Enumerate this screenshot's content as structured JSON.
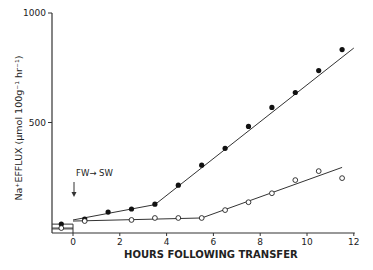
{
  "chart_data": {
    "type": "line",
    "title": "",
    "xlabel": "HOURS FOLLOWING TRANSFER",
    "ylabel": "Na⁺EFFLUX (μmol 100g⁻¹ hr⁻¹)",
    "xlim": [
      -1,
      12
    ],
    "ylim": [
      0,
      1000
    ],
    "x_ticks": [
      0,
      2,
      4,
      6,
      8,
      10,
      12
    ],
    "x_tick_labels": [
      "0",
      "2",
      "4",
      "6",
      "8",
      "10",
      "12"
    ],
    "y_ticks": [
      500,
      1000
    ],
    "y_tick_labels": [
      "500",
      "1000"
    ],
    "grid": false,
    "legend": "none",
    "annotations": [
      {
        "text": "FW→ SW",
        "x": 0,
        "note": "arrow pointing down at time 0 marking transfer from fresh water to sea water"
      }
    ],
    "series": [
      {
        "name": "filled circles",
        "marker": "filled-circle",
        "x": [
          -0.5,
          0.5,
          1.5,
          2.5,
          3.5,
          4.5,
          5.5,
          6.5,
          7.5,
          8.5,
          9.5,
          10.5,
          11.5
        ],
        "values": [
          36,
          59,
          91,
          105,
          127,
          214,
          305,
          382,
          482,
          569,
          637,
          737,
          833
        ]
      },
      {
        "name": "open circles",
        "marker": "open-circle",
        "x": [
          -0.5,
          0.5,
          2.5,
          3.5,
          4.5,
          5.5,
          6.5,
          7.5,
          8.5,
          9.5,
          10.5,
          11.5
        ],
        "values": [
          18,
          50,
          55,
          64,
          64,
          64,
          100,
          136,
          177,
          237,
          278,
          246
        ]
      }
    ],
    "fit_lines": [
      {
        "series": "filled circles",
        "segments": [
          [
            [
              0,
              55
            ],
            [
              3.5,
              125
            ]
          ],
          [
            [
              3.5,
              125
            ],
            [
              12,
              840
            ]
          ]
        ]
      },
      {
        "series": "open circles",
        "segments": [
          [
            [
              0,
              50
            ],
            [
              5.5,
              64
            ]
          ],
          [
            [
              5.5,
              64
            ],
            [
              11.5,
              295
            ]
          ]
        ]
      }
    ],
    "control_baseline": {
      "x": [
        -1,
        0
      ],
      "filled": 36,
      "open": 18
    }
  }
}
